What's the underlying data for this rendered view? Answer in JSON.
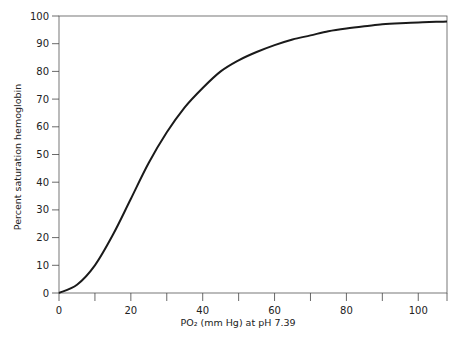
{
  "chart_data": {
    "type": "line",
    "title": "",
    "xlabel": "PO₂ (mm Hg) at pH 7.39",
    "ylabel": "Percent saturation hemoglobin",
    "xlim": [
      0,
      108
    ],
    "ylim": [
      0,
      100
    ],
    "x_ticks": [
      0,
      10,
      20,
      30,
      40,
      50,
      60,
      70,
      80,
      90,
      100
    ],
    "x_tick_labels": [
      "0",
      "",
      "20",
      "",
      "40",
      "",
      "60",
      "",
      "80",
      "",
      "100"
    ],
    "y_ticks": [
      0,
      10,
      20,
      30,
      40,
      50,
      60,
      70,
      80,
      90,
      100
    ],
    "y_tick_labels": [
      "0",
      "10",
      "20",
      "30",
      "40",
      "50",
      "60",
      "70",
      "80",
      "90",
      "100"
    ],
    "grid": false,
    "legend": null,
    "series": [
      {
        "name": "Oxyhemoglobin dissociation curve",
        "x": [
          0,
          5,
          10,
          15,
          20,
          25,
          30,
          35,
          40,
          45,
          50,
          55,
          60,
          65,
          70,
          75,
          80,
          85,
          90,
          95,
          100,
          105,
          108
        ],
        "values": [
          0,
          3,
          10,
          21,
          34,
          47,
          58,
          67,
          74,
          80,
          84,
          87,
          89.5,
          91.5,
          93,
          94.5,
          95.5,
          96.3,
          97,
          97.4,
          97.7,
          97.9,
          98
        ]
      }
    ]
  }
}
